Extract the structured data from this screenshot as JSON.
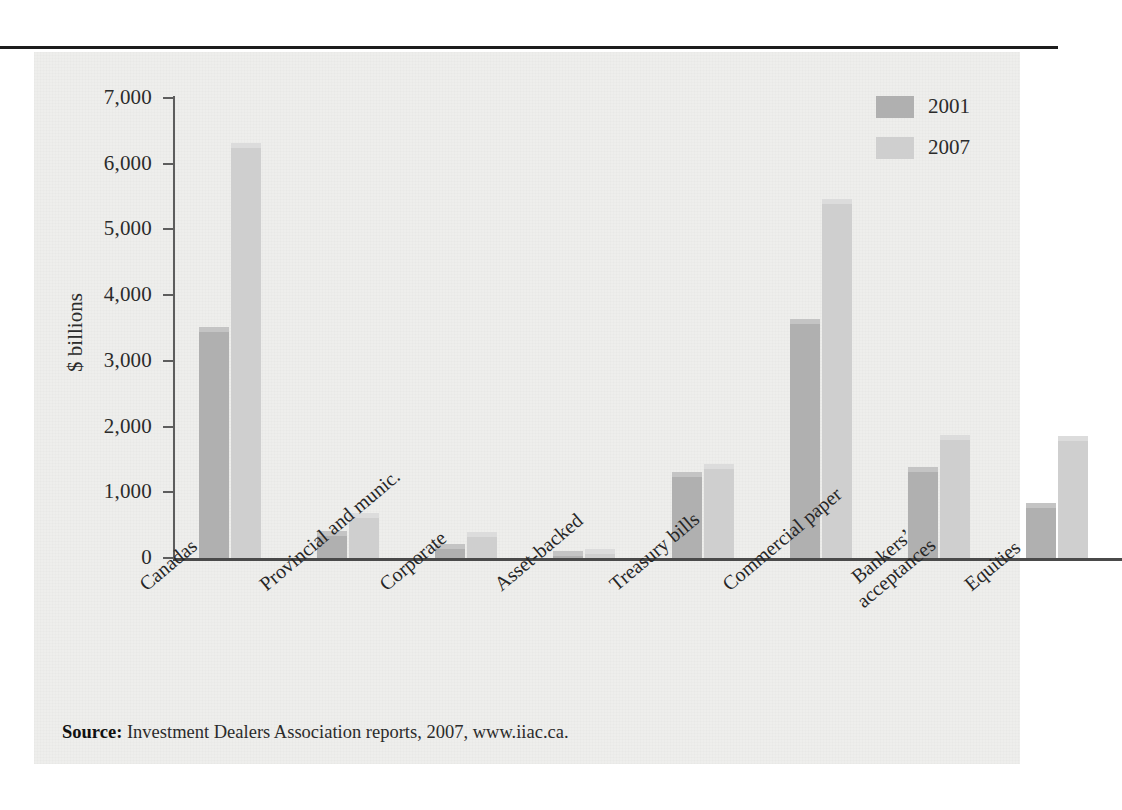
{
  "figure": {
    "y_axis_title": "$ billions",
    "source_label": "Source:",
    "source_text": " Investment Dealers Association reports, 2007, www.iiac.ca."
  },
  "legend": {
    "position": "top-right",
    "entries": [
      {
        "label": "2001",
        "color": "#b0b0b0"
      },
      {
        "label": "2007",
        "color": "#cfcfcf"
      }
    ]
  },
  "chart_data": {
    "type": "bar",
    "title": "",
    "subtitle": "",
    "xlabel": "",
    "ylabel": "$ billions",
    "ylim": [
      0,
      7000
    ],
    "ytick_labels": [
      "0",
      "1,000",
      "2,000",
      "3,000",
      "4,000",
      "5,000",
      "6,000",
      "7,000"
    ],
    "yticks": [
      0,
      1000,
      2000,
      3000,
      4000,
      5000,
      6000,
      7000
    ],
    "grid": false,
    "legend_position": "top-right",
    "categories": [
      "Canadas",
      "Provincial and munic.",
      "Corporate",
      "Asset-backed",
      "Treasury bills",
      "Commercial paper",
      "Bankers'\nacceptances",
      "Equities"
    ],
    "category_labels_display": [
      "Canadas",
      "Provincial and munic.",
      "Corporate",
      "Asset-backed",
      "Treasury bills",
      "Commercial paper",
      "Bankers’|acceptances",
      "Equities"
    ],
    "series": [
      {
        "name": "2001",
        "color": "#b0b0b0",
        "values": [
          3450,
          350,
          150,
          50,
          1250,
          3580,
          1330,
          780
        ]
      },
      {
        "name": "2007",
        "color": "#cfcfcf",
        "values": [
          6250,
          620,
          340,
          80,
          1370,
          5400,
          1810,
          1790
        ]
      }
    ]
  }
}
